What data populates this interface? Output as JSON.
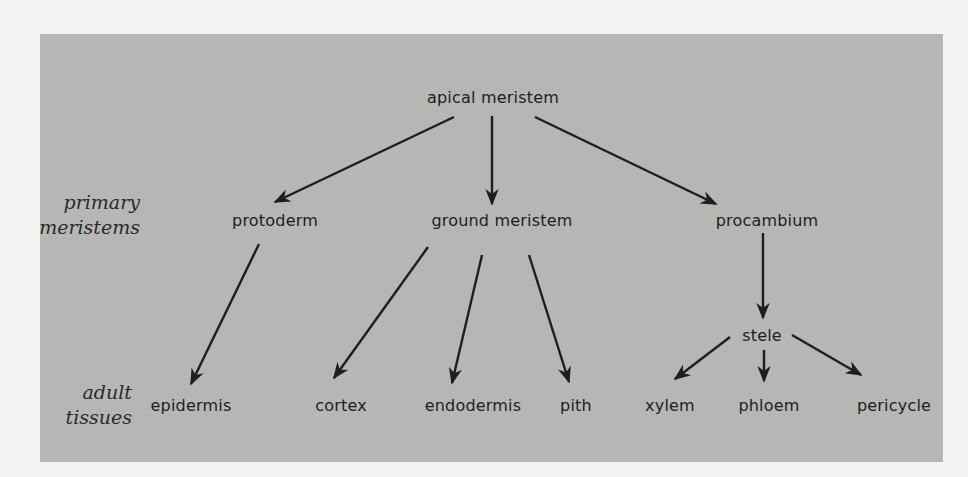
{
  "diagram": {
    "background_color": "#b6b6b4",
    "text_color": "#1e1e1e",
    "row_labels": {
      "primary": [
        "primary",
        "meristems"
      ],
      "adult": [
        "adult",
        "tissues"
      ]
    },
    "nodes": {
      "apical_meristem": "apical meristem",
      "protoderm": "protoderm",
      "ground_meristem": "ground meristem",
      "procambium": "procambium",
      "stele": "stele",
      "epidermis": "epidermis",
      "cortex": "cortex",
      "endodermis": "endodermis",
      "pith": "pith",
      "xylem": "xylem",
      "phloem": "phloem",
      "pericycle": "pericycle"
    },
    "edges": [
      {
        "from": "apical meristem",
        "to": "protoderm"
      },
      {
        "from": "apical meristem",
        "to": "ground meristem"
      },
      {
        "from": "apical meristem",
        "to": "procambium"
      },
      {
        "from": "protoderm",
        "to": "epidermis"
      },
      {
        "from": "ground meristem",
        "to": "cortex"
      },
      {
        "from": "ground meristem",
        "to": "endodermis"
      },
      {
        "from": "ground meristem",
        "to": "pith"
      },
      {
        "from": "procambium",
        "to": "stele"
      },
      {
        "from": "stele",
        "to": "xylem"
      },
      {
        "from": "stele",
        "to": "phloem"
      },
      {
        "from": "stele",
        "to": "pericycle"
      }
    ]
  }
}
